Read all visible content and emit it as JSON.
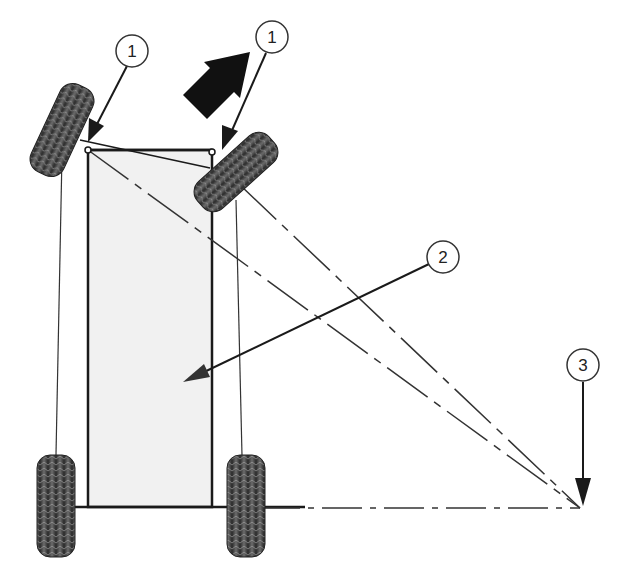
{
  "diagram": {
    "callouts": [
      {
        "id": "callout-1a",
        "label": "1",
        "target": "left front steering pivot"
      },
      {
        "id": "callout-1b",
        "label": "1",
        "target": "right front steering pivot"
      },
      {
        "id": "callout-2",
        "label": "2",
        "target": "vehicle body / chassis"
      },
      {
        "id": "callout-3",
        "label": "3",
        "target": "turning center point"
      }
    ],
    "direction_arrow": "forward-right-turn-arrow",
    "colors": {
      "ink": "#1a1a1a",
      "body_fill": "#f1f1f1",
      "tire_dark": "#3a3a3a",
      "tire_light": "#8a8a8a",
      "background": "#ffffff"
    }
  }
}
